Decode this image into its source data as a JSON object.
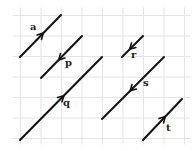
{
  "diagram": {
    "type": "vector-grid",
    "grid": {
      "x0": 20.5,
      "y0": 15.5,
      "spacing": 20.5,
      "cols": 8,
      "rows": 6,
      "color": "#e4e4e4"
    },
    "stroke_color": "#111111",
    "vectors": [
      {
        "name": "a",
        "label": "a",
        "from": [
          20,
          57
        ],
        "to": [
          61,
          15
        ],
        "direction": "up-right",
        "label_pos": [
          30,
          30
        ]
      },
      {
        "name": "p",
        "label": "p",
        "from": [
          82,
          36
        ],
        "to": [
          41,
          78
        ],
        "direction": "down-left",
        "label_pos": [
          65,
          66
        ]
      },
      {
        "name": "q",
        "label": "q",
        "from": [
          20,
          140
        ],
        "to": [
          102,
          57
        ],
        "direction": "up-right",
        "label_pos": [
          63,
          106
        ]
      },
      {
        "name": "r",
        "label": "r",
        "from": [
          143,
          36
        ],
        "to": [
          122,
          57
        ],
        "direction": "down-left",
        "label_pos": [
          131,
          58
        ]
      },
      {
        "name": "s",
        "label": "s",
        "from": [
          164,
          57
        ],
        "to": [
          102,
          119
        ],
        "direction": "down-left",
        "label_pos": [
          143,
          86
        ]
      },
      {
        "name": "t",
        "label": "t",
        "from": [
          143,
          140
        ],
        "to": [
          182,
          99
        ],
        "direction": "up-right",
        "label_pos": [
          166,
          131
        ]
      }
    ]
  }
}
